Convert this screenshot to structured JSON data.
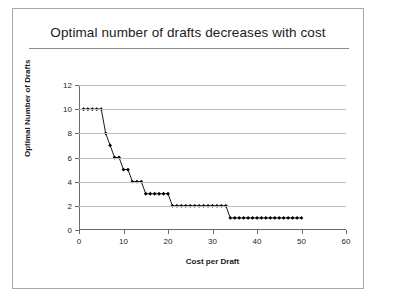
{
  "slide": {
    "title": "Optimal number of drafts decreases with cost"
  },
  "chart_data": {
    "type": "line",
    "title": "Optimal number of drafts decreases with cost",
    "xlabel": "Cost per Draft",
    "ylabel": "Optimal Number of Drafts",
    "xlim": [
      0,
      60
    ],
    "ylim": [
      0,
      12
    ],
    "xticks": [
      0,
      10,
      20,
      30,
      40,
      50,
      60
    ],
    "yticks": [
      0,
      2,
      4,
      6,
      8,
      10,
      12
    ],
    "grid": "horizontal",
    "legend": "none",
    "marker": "diamond",
    "marker_color": "#000000",
    "line_color": "#1a1a1a",
    "series": [
      {
        "name": "Optimal Number of Drafts",
        "x": [
          1,
          2,
          3,
          4,
          5,
          6,
          7,
          8,
          9,
          10,
          11,
          12,
          13,
          14,
          15,
          16,
          17,
          18,
          19,
          20,
          21,
          22,
          23,
          24,
          25,
          26,
          27,
          28,
          29,
          30,
          31,
          32,
          33,
          34,
          35,
          36,
          37,
          38,
          39,
          40,
          41,
          42,
          43,
          44,
          45,
          46,
          47,
          48,
          49,
          50
        ],
        "y": [
          10,
          10,
          10,
          10,
          10,
          8,
          7,
          6,
          6,
          5,
          5,
          4,
          4,
          4,
          3,
          3,
          3,
          3,
          3,
          3,
          2,
          2,
          2,
          2,
          2,
          2,
          2,
          2,
          2,
          2,
          2,
          2,
          2,
          1,
          1,
          1,
          1,
          1,
          1,
          1,
          1,
          1,
          1,
          1,
          1,
          1,
          1,
          1,
          1,
          1
        ]
      }
    ]
  }
}
